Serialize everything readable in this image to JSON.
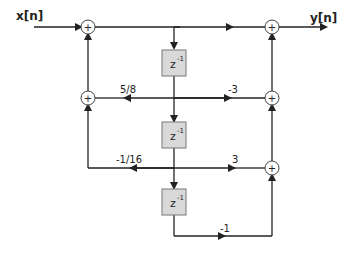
{
  "diagram": {
    "input_label": "x[n]",
    "output_label": "y[n]",
    "delay_label": "z",
    "delay_exp": "-1",
    "feedback_gains": [
      "5/8",
      "-1/16"
    ],
    "feedforward_gains": [
      "-3",
      "3",
      "-1"
    ],
    "adder_symbol": "+",
    "colors": {
      "line": "#222222",
      "delay_fill": "#d9d9d9",
      "delay_border": "#777777"
    }
  }
}
